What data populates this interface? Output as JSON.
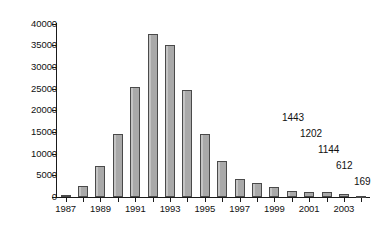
{
  "chart_data": {
    "type": "bar",
    "title": "",
    "subtitle": "",
    "xlabel": "",
    "ylabel": "",
    "ylim": [
      0,
      40000
    ],
    "xlim": [
      1986.5,
      2004.5
    ],
    "grid": false,
    "legend": null,
    "y_ticks": [
      0,
      5000,
      10000,
      15000,
      20000,
      25000,
      30000,
      35000,
      40000
    ],
    "y_tick_labels": [
      "0",
      "5000",
      "10000",
      "15000",
      "20000",
      "25000",
      "30000",
      "35000",
      "40000"
    ],
    "categories": [
      "1987",
      "1988",
      "1989",
      "1990",
      "1991",
      "1992",
      "1993",
      "1994",
      "1995",
      "1996",
      "1997",
      "1998",
      "1999",
      "2000",
      "2001",
      "2002",
      "2003",
      "2004"
    ],
    "x_tick_labels": [
      "1987",
      "1989",
      "1991",
      "1993",
      "1995",
      "1997",
      "1999",
      "2001",
      "2003"
    ],
    "values": [
      400,
      2500,
      7200,
      14500,
      25400,
      37500,
      35100,
      24600,
      14600,
      8200,
      4200,
      3300,
      2400,
      1443,
      1202,
      1144,
      612,
      169
    ],
    "bar_color": "#a9a9a9",
    "bar_edge_color": "#4a4a4a",
    "annotations": [
      {
        "text": "1443",
        "category": "2000",
        "value": 1443
      },
      {
        "text": "1202",
        "category": "2001",
        "value": 1202
      },
      {
        "text": "1144",
        "category": "2002",
        "value": 1144
      },
      {
        "text": "612",
        "category": "2003",
        "value": 612
      },
      {
        "text": "169",
        "category": "2004",
        "value": 169
      }
    ]
  },
  "colors": {
    "axis": "#1a1a1a",
    "text": "#111111",
    "background": "#ffffff",
    "bar_fill": "#a9a9a9",
    "bar_stroke": "#4a4a4a"
  }
}
